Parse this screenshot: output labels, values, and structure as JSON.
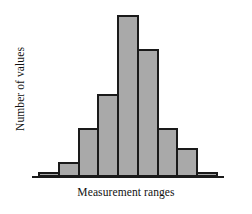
{
  "chart_data": {
    "type": "bar",
    "title": "",
    "subtitle": "",
    "xlabel": "Measurement ranges",
    "ylabel": "Number of values",
    "categories": [
      "1",
      "2",
      "3",
      "4",
      "5",
      "6",
      "7",
      "8",
      "9"
    ],
    "values": [
      1,
      3,
      10,
      17,
      33,
      26,
      10,
      6,
      1
    ],
    "ylim": [
      0,
      34
    ],
    "grid": false,
    "legend": null,
    "axis_ticks": false,
    "tick_labels": [],
    "annotations": [],
    "bar_fill_color": "#a9a9a9",
    "bar_border_color": "#1a1a1a",
    "axis_color": "#1a1a1a",
    "background_color": "#ffffff"
  }
}
